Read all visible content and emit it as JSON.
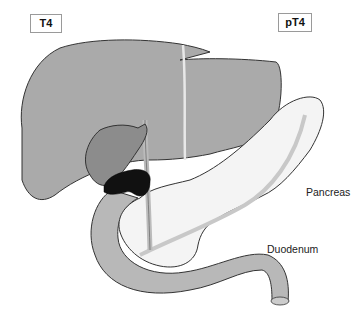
{
  "labels": {
    "stage_left": "T4",
    "stage_right": "pT4",
    "pancreas": "Pancreas",
    "duodenum": "Duodenum"
  },
  "colors": {
    "liver": "#a9a9a9",
    "gallbladder": "#8a8a8a",
    "tumor": "#111111",
    "pancreas": "#f4f4f4",
    "duodenum": "#9e9e9e",
    "duct": "#cfcfcf",
    "outline": "#333333"
  }
}
